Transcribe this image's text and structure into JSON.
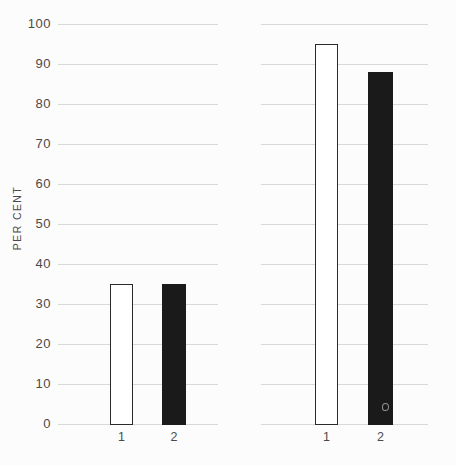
{
  "axis": {
    "ylabel": "PER CENT",
    "yticks": [
      100,
      90,
      80,
      70,
      60,
      50,
      40,
      30,
      20,
      10,
      0
    ]
  },
  "chart_data": [
    {
      "type": "bar",
      "panel": "left",
      "title": "",
      "categories": [
        "1",
        "2"
      ],
      "values": [
        35,
        35
      ],
      "bar_fills": [
        "white-outlined",
        "solid-black"
      ],
      "ylabel": "PER CENT",
      "xlabel": "",
      "ylim": [
        0,
        100
      ],
      "yticks": [
        0,
        10,
        20,
        30,
        40,
        50,
        60,
        70,
        80,
        90,
        100
      ],
      "grid": true,
      "legend": "none"
    },
    {
      "type": "bar",
      "panel": "right",
      "title": "",
      "categories": [
        "1",
        "2"
      ],
      "values": [
        95,
        88
      ],
      "bar_fills": [
        "white-outlined",
        "solid-black"
      ],
      "ylabel": "",
      "xlabel": "",
      "ylim": [
        0,
        100
      ],
      "yticks": [
        0,
        10,
        20,
        30,
        40,
        50,
        60,
        70,
        80,
        90,
        100
      ],
      "grid": true,
      "legend": "none"
    }
  ],
  "colors": {
    "background": "#fcfcfc",
    "gridline": "#d9d9d9",
    "text": "#4a4a4a",
    "bar_black": "#1a1a1a",
    "bar_white": "#ffffff",
    "bar_outline": "#2a2a2a"
  }
}
